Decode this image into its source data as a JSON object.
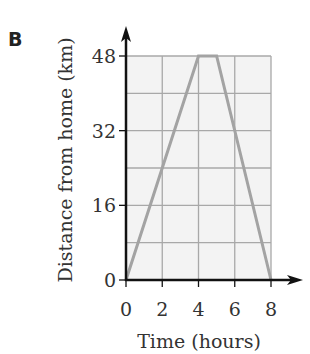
{
  "panel_label": "B",
  "chart_data": {
    "type": "line",
    "title": "",
    "xlabel": "Time (hours)",
    "ylabel": "Distance from home (km)",
    "x_ticks": [
      0,
      2,
      4,
      6,
      8
    ],
    "y_ticks": [
      0,
      16,
      32,
      48
    ],
    "xlim": [
      0,
      8
    ],
    "ylim": [
      0,
      48
    ],
    "grid": true,
    "grid_x_step": 2,
    "grid_y_step": 8,
    "series": [
      {
        "name": "journey",
        "x": [
          0,
          4,
          5,
          8
        ],
        "y": [
          0,
          48,
          48,
          0
        ],
        "color": "#a3a3a3"
      }
    ],
    "colors": {
      "grid_fill": "#f3f3f3",
      "grid_line": "#a8a8a8",
      "axis": "#111111"
    }
  },
  "labels": {
    "x_ticks": [
      "0",
      "2",
      "4",
      "6",
      "8"
    ],
    "y_ticks": [
      "0",
      "16",
      "32",
      "48"
    ]
  }
}
